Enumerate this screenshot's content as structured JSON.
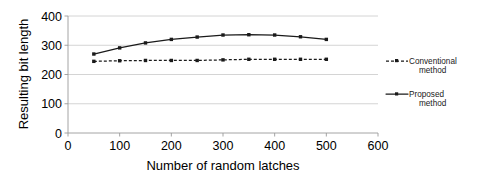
{
  "chart_data": {
    "type": "line",
    "title": "",
    "subtitle": "",
    "xlabel": "Number of random latches",
    "ylabel": "Resulting bit length",
    "xlim": [
      0,
      600
    ],
    "ylim": [
      0,
      400
    ],
    "xticks": [
      0,
      100,
      200,
      300,
      400,
      500,
      600
    ],
    "yticks": [
      0,
      100,
      200,
      300,
      400
    ],
    "xtick_labels": [
      "0",
      "100",
      "200",
      "300",
      "400",
      "500",
      "600"
    ],
    "ytick_labels": [
      "0",
      "100",
      "200",
      "300",
      "400"
    ],
    "grid": "horizontal",
    "legend_position": "right",
    "x": [
      50,
      100,
      150,
      200,
      250,
      300,
      350,
      400,
      450,
      500
    ],
    "series": [
      {
        "name": "Conventional method",
        "style": "dashed",
        "marker": "square",
        "color": "#1a1a1a",
        "values": [
          245,
          247,
          248,
          248,
          248,
          250,
          252,
          252,
          252,
          252
        ]
      },
      {
        "name": "Proposed method",
        "style": "solid",
        "marker": "square",
        "color": "#1a1a1a",
        "values": [
          270,
          291,
          308,
          320,
          328,
          335,
          336,
          335,
          329,
          320
        ]
      }
    ]
  },
  "legend": {
    "entries": [
      {
        "label_line1": "Conventional",
        "label_line2": "method",
        "style": "dashed"
      },
      {
        "label_line1": "Proposed",
        "label_line2": "method",
        "style": "solid"
      }
    ]
  },
  "axes": {
    "y_title": "Resulting bit length",
    "x_title": "Number of random latches"
  }
}
